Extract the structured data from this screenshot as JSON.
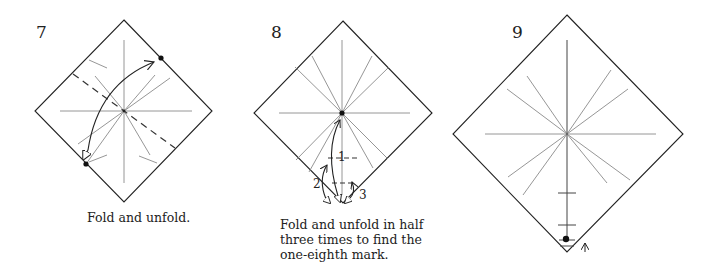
{
  "steps": [
    {
      "number": "7",
      "caption_lines": [
        "Fold and unfold."
      ]
    },
    {
      "number": "8",
      "caption_lines": [
        "Fold and unfold in half",
        "three times to find the",
        "one-eighth mark."
      ],
      "fold_labels": [
        "1",
        "2",
        "3"
      ]
    },
    {
      "number": "9",
      "caption_lines": []
    }
  ],
  "colors": {
    "outline": "#222222",
    "crease": "#8a8a8a",
    "arrow": "#222222",
    "dashed": "#333333"
  }
}
